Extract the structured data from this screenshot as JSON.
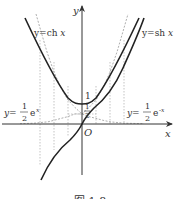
{
  "figure": {
    "axes": {
      "x_label": "x",
      "y_label": "y",
      "origin_label": "O"
    },
    "curves": [
      {
        "name": "ch",
        "label_prefix": "y=ch ",
        "label_var": "x",
        "style": "solid-thick"
      },
      {
        "name": "sh",
        "label_prefix": "y=sh ",
        "label_var": "x",
        "style": "solid-thick"
      },
      {
        "name": "half_exp_pos",
        "label_prefix": "y=",
        "frac_num": "1",
        "frac_den": "2",
        "label_suffix": "e",
        "exponent": "x",
        "style": "dashed"
      },
      {
        "name": "half_exp_neg",
        "label_prefix": "y=",
        "frac_num": "1",
        "frac_den": "2",
        "label_suffix": "e",
        "exponent": "-x",
        "style": "dashed"
      }
    ],
    "y_ticks": {
      "one": "1",
      "half_num": "1",
      "half_den": "2"
    },
    "caption": "图 1-8",
    "colors": {
      "curve": "#222222",
      "axis": "#333333",
      "dashed": "#999999"
    }
  }
}
